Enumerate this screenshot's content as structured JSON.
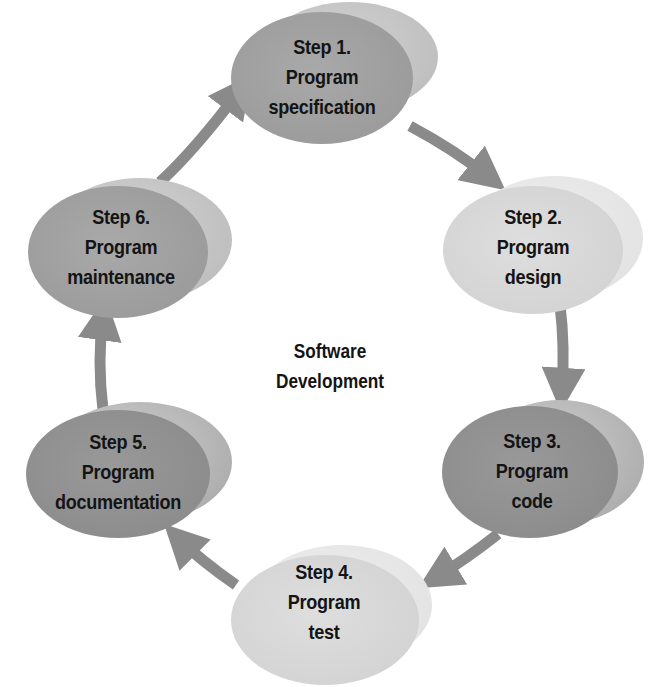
{
  "diagram": {
    "title": "Software Development",
    "title_lines": [
      "Software",
      "Development"
    ],
    "colors": {
      "background": "#ffffff",
      "arrow": "#8a8a8a",
      "text": "#141414",
      "dark_node": "#999999",
      "light_node": "#d9d9d9"
    },
    "steps": [
      {
        "step": "Step 1.",
        "line2": "Program",
        "line3": "specification",
        "shade": "medium"
      },
      {
        "step": "Step 2.",
        "line2": "Program",
        "line3": "design",
        "shade": "light"
      },
      {
        "step": "Step 3.",
        "line2": "Program",
        "line3": "code",
        "shade": "dark"
      },
      {
        "step": "Step 4.",
        "line2": "Program",
        "line3": "test",
        "shade": "light"
      },
      {
        "step": "Step 5.",
        "line2": "Program",
        "line3": "documentation",
        "shade": "dark"
      },
      {
        "step": "Step 6.",
        "line2": "Program",
        "line3": "maintenance",
        "shade": "medium"
      }
    ],
    "flow": [
      "Step 1 → Step 2",
      "Step 2 → Step 3",
      "Step 3 → Step 4",
      "Step 4 → Step 5",
      "Step 5 → Step 6",
      "Step 6 → Step 1"
    ]
  }
}
